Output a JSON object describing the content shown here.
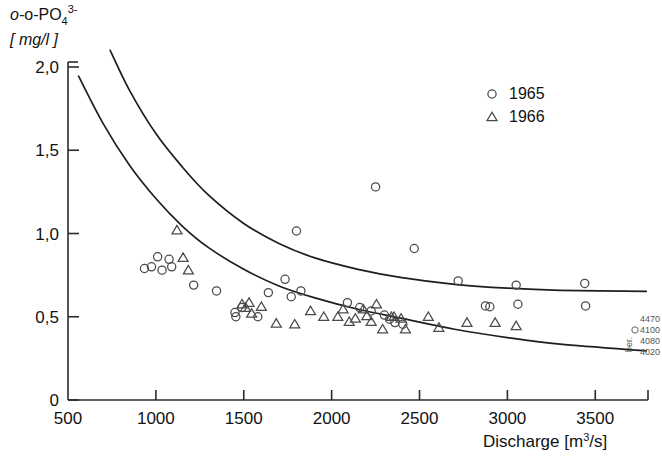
{
  "chart_data": {
    "type": "scatter",
    "title": "",
    "ylabel_main": "o-PO",
    "ylabel_sub": "4",
    "ylabel_sup": "3-",
    "ylabel_prefix": "o-",
    "ylabel_units": "[ mg/l ]",
    "xlabel": "Discharge [m",
    "xlabel_sup": "3",
    "xlabel_tail": "/s]",
    "xlabel_full": "Discharge [m3/s]",
    "xlim": [
      500,
      3800
    ],
    "ylim": [
      0,
      2.0
    ],
    "xticks": [
      500,
      1000,
      1500,
      2000,
      2500,
      3000,
      3500
    ],
    "xtick_labels": [
      "500",
      "1000",
      "1500",
      "2000",
      "2500",
      "3000",
      "3500"
    ],
    "yticks": [
      0,
      0.5,
      1.0,
      1.5,
      2.0
    ],
    "ytick_labels": [
      "0",
      "0,5",
      "1,0",
      "1,5",
      "2,0"
    ],
    "grid": false,
    "legend_position": "top-right",
    "series": [
      {
        "name": "1965",
        "marker": "circle",
        "color": "#4a4a4a",
        "points": [
          [
            935,
            0.79
          ],
          [
            975,
            0.8
          ],
          [
            1010,
            0.86
          ],
          [
            1035,
            0.78
          ],
          [
            1075,
            0.845
          ],
          [
            1090,
            0.8
          ],
          [
            1215,
            0.69
          ],
          [
            1345,
            0.655
          ],
          [
            1450,
            0.525
          ],
          [
            1455,
            0.5
          ],
          [
            1490,
            0.555
          ],
          [
            1580,
            0.5
          ],
          [
            1640,
            0.645
          ],
          [
            1735,
            0.725
          ],
          [
            1770,
            0.62
          ],
          [
            1800,
            1.015
          ],
          [
            1825,
            0.655
          ],
          [
            2090,
            0.585
          ],
          [
            2160,
            0.555
          ],
          [
            2225,
            0.535
          ],
          [
            2250,
            1.28
          ],
          [
            2300,
            0.51
          ],
          [
            2330,
            0.485
          ],
          [
            2360,
            0.465
          ],
          [
            2405,
            0.455
          ],
          [
            2470,
            0.91
          ],
          [
            2720,
            0.715
          ],
          [
            2875,
            0.565
          ],
          [
            2900,
            0.56
          ],
          [
            3050,
            0.69
          ],
          [
            3060,
            0.575
          ],
          [
            3440,
            0.7
          ],
          [
            3445,
            0.565
          ]
        ]
      },
      {
        "name": "1966",
        "marker": "triangle",
        "color": "#4a4a4a",
        "points": [
          [
            1120,
            1.02
          ],
          [
            1155,
            0.855
          ],
          [
            1185,
            0.78
          ],
          [
            1490,
            0.575
          ],
          [
            1510,
            0.555
          ],
          [
            1530,
            0.585
          ],
          [
            1545,
            0.52
          ],
          [
            1600,
            0.56
          ],
          [
            1685,
            0.46
          ],
          [
            1790,
            0.455
          ],
          [
            1880,
            0.535
          ],
          [
            1955,
            0.5
          ],
          [
            2035,
            0.5
          ],
          [
            2065,
            0.545
          ],
          [
            2100,
            0.47
          ],
          [
            2135,
            0.49
          ],
          [
            2180,
            0.545
          ],
          [
            2200,
            0.505
          ],
          [
            2225,
            0.47
          ],
          [
            2255,
            0.575
          ],
          [
            2290,
            0.425
          ],
          [
            2340,
            0.5
          ],
          [
            2355,
            0.5
          ],
          [
            2395,
            0.49
          ],
          [
            2420,
            0.425
          ],
          [
            2550,
            0.5
          ],
          [
            2610,
            0.435
          ],
          [
            2770,
            0.465
          ],
          [
            2930,
            0.465
          ],
          [
            3050,
            0.445
          ]
        ]
      }
    ],
    "curves": [
      {
        "name": "upper-envelope-curve",
        "points": [
          [
            740,
            2.1
          ],
          [
            850,
            1.86
          ],
          [
            1000,
            1.6
          ],
          [
            1150,
            1.4
          ],
          [
            1300,
            1.23
          ],
          [
            1500,
            1.06
          ],
          [
            1700,
            0.94
          ],
          [
            1900,
            0.855
          ],
          [
            2150,
            0.785
          ],
          [
            2400,
            0.735
          ],
          [
            2700,
            0.695
          ],
          [
            3000,
            0.672
          ],
          [
            3300,
            0.659
          ],
          [
            3790,
            0.652
          ]
        ]
      },
      {
        "name": "lower-envelope-curve",
        "points": [
          [
            560,
            1.945
          ],
          [
            700,
            1.66
          ],
          [
            850,
            1.41
          ],
          [
            1000,
            1.21
          ],
          [
            1150,
            1.045
          ],
          [
            1300,
            0.915
          ],
          [
            1500,
            0.785
          ],
          [
            1700,
            0.685
          ],
          [
            1900,
            0.615
          ],
          [
            2150,
            0.545
          ],
          [
            2400,
            0.49
          ],
          [
            2700,
            0.425
          ],
          [
            3000,
            0.375
          ],
          [
            3300,
            0.335
          ],
          [
            3790,
            0.295
          ]
        ]
      }
    ],
    "annotations": []
  },
  "legend": {
    "entries": [
      {
        "label": "1965",
        "marker": "circle"
      },
      {
        "label": "1966",
        "marker": "triangle"
      }
    ]
  },
  "margin_notes": {
    "lines": [
      "4470",
      "4100",
      "4080",
      "4020"
    ],
    "side_text": "ber."
  }
}
